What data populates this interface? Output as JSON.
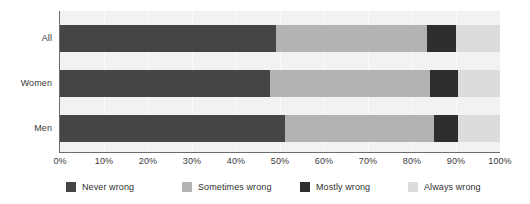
{
  "chart_data": {
    "type": "bar",
    "orientation": "horizontal",
    "stacked": true,
    "stack_total": 100,
    "title": "",
    "subtitle": "",
    "xlabel": "",
    "ylabel": "",
    "xlim": [
      0,
      100
    ],
    "grid": true,
    "legend_position": "bottom",
    "categories": [
      "All",
      "Women",
      "Men"
    ],
    "tick_labels": [
      "0%",
      "10%",
      "20%",
      "30%",
      "40%",
      "50%",
      "60%",
      "70%",
      "80%",
      "90%",
      "100%"
    ],
    "tick_values": [
      0,
      10,
      20,
      30,
      40,
      50,
      60,
      70,
      80,
      90,
      100
    ],
    "series": [
      {
        "name": "Never wrong",
        "color": "#454545",
        "values": [
          49.0,
          47.7,
          51.2
        ]
      },
      {
        "name": "Sometimes wrong",
        "color": "#b3b3b3",
        "values": [
          34.5,
          36.3,
          33.8
        ]
      },
      {
        "name": "Mostly wrong",
        "color": "#2e2e2e",
        "values": [
          6.5,
          6.5,
          5.5
        ]
      },
      {
        "name": "Always wrong",
        "color": "#dcdcdc",
        "values": [
          10.0,
          9.5,
          9.5
        ]
      }
    ]
  },
  "colors": {
    "plot_background": "#f2f2f2",
    "gridline": "#fbfbfb",
    "axis": "#6d6d6d",
    "text": "#3a3a3a",
    "page_background": "#ffffff"
  },
  "legend": {
    "items": [
      {
        "label": "Never wrong",
        "color": "#454545"
      },
      {
        "label": "Sometimes wrong",
        "color": "#b3b3b3"
      },
      {
        "label": "Mostly wrong",
        "color": "#2e2e2e"
      },
      {
        "label": "Always wrong",
        "color": "#dcdcdc"
      }
    ]
  }
}
